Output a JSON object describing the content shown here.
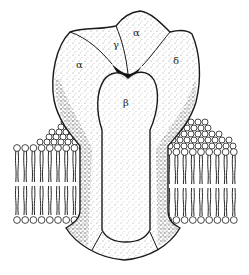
{
  "figure": {
    "subunit_labels": {
      "alpha_left": "α",
      "gamma": "γ",
      "alpha_top": "α",
      "delta": "δ",
      "beta": "β"
    },
    "colors": {
      "ink": "#1a1a1a",
      "paper": "#ffffff",
      "stipple": "#333333"
    }
  }
}
